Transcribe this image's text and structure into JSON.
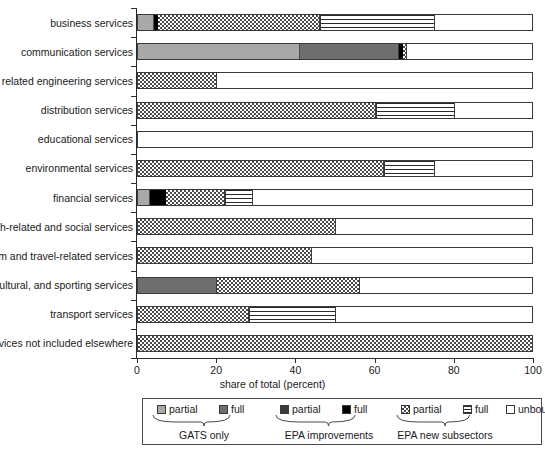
{
  "chart_data": {
    "type": "bar",
    "orientation": "horizontal",
    "stacked": true,
    "title": "",
    "xlabel": "share of total (percent)",
    "ylabel": "",
    "xlim": [
      0,
      100
    ],
    "xticks": [
      0,
      20,
      40,
      60,
      80,
      100
    ],
    "grid": false,
    "legend_position": "bottom",
    "categories": [
      "business services",
      "communication services",
      "construction and related engineering services",
      "distribution services",
      "educational services",
      "environmental services",
      "financial services",
      "health-related and social services",
      "tourism and travel-related services",
      "recreational, cultural, and sporting services",
      "transport services",
      "other services not included elsewhere"
    ],
    "series": [
      {
        "name": "GATS only partial",
        "key": "gats-partial",
        "color": "#a8a8a8",
        "values": [
          4,
          41,
          0,
          0,
          0,
          0,
          3,
          0,
          0,
          0,
          0,
          0
        ]
      },
      {
        "name": "GATS only full",
        "key": "gats-full",
        "color": "#6e6e6e",
        "values": [
          0,
          25,
          0,
          0,
          0,
          0,
          0,
          0,
          0,
          20,
          0,
          0
        ]
      },
      {
        "name": "EPA improvements partial",
        "key": "epa-imp-partial",
        "color": "#3a3a3a",
        "values": [
          0,
          0,
          0,
          0,
          0,
          0,
          0,
          0,
          0,
          0,
          0,
          0
        ]
      },
      {
        "name": "EPA improvements full",
        "key": "epa-imp-full",
        "color": "#000000",
        "values": [
          1,
          1,
          0,
          0,
          0,
          0,
          4,
          0,
          0,
          0,
          0,
          0
        ]
      },
      {
        "name": "EPA new subsectors partial",
        "key": "epa-new-partial",
        "color": "#4a4a4a",
        "values": [
          41,
          1,
          20,
          60,
          0,
          62,
          15,
          50,
          44,
          36,
          28,
          100
        ]
      },
      {
        "name": "EPA new subsectors full",
        "key": "epa-new-full",
        "color": "#2b2b2b",
        "values": [
          29,
          0,
          0,
          20,
          0,
          13,
          7,
          0,
          0,
          0,
          22,
          0
        ]
      },
      {
        "name": "unbound",
        "key": "unbound",
        "color": "#ffffff",
        "values": [
          25,
          32,
          80,
          20,
          100,
          25,
          71,
          50,
          56,
          44,
          50,
          0
        ]
      }
    ],
    "legend": {
      "entries": [
        {
          "label": "partial",
          "key": "gats-partial"
        },
        {
          "label": "full",
          "key": "gats-full"
        },
        {
          "label": "partial",
          "key": "epa-imp-partial"
        },
        {
          "label": "full",
          "key": "epa-imp-full"
        },
        {
          "label": "partial",
          "key": "epa-new-partial"
        },
        {
          "label": "full",
          "key": "epa-new-full"
        },
        {
          "label": "unbound",
          "key": "unbound"
        }
      ],
      "groups": [
        {
          "label": "GATS only"
        },
        {
          "label": "EPA improvements"
        },
        {
          "label": "EPA new subsectors"
        }
      ]
    }
  }
}
